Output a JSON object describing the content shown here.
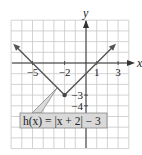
{
  "chart_data": {
    "type": "line",
    "title": "",
    "function_label": "h(x) = |x + 2| − 3",
    "xlabel": "x",
    "ylabel": "y",
    "xlim": [
      -7,
      4
    ],
    "ylim": [
      -8,
      4
    ],
    "grid": true,
    "x_tick_labels": [
      "−5",
      "−2",
      "1",
      "3"
    ],
    "x_tick_values": [
      -5,
      -2,
      1,
      3
    ],
    "y_tick_labels": [
      "−3",
      "−4"
    ],
    "y_tick_values": [
      -3,
      -4
    ],
    "series": [
      {
        "name": "h(x) = |x + 2| − 3",
        "x": [
          -6.5,
          -5,
          -2,
          1,
          2.5
        ],
        "y": [
          1.5,
          0,
          -3,
          0,
          1.5
        ],
        "vertex": [
          -2,
          -3
        ]
      }
    ],
    "colors": {
      "grid": "#c8c8c8",
      "axis": "#333333",
      "line": "#555555",
      "label_box_fill": "#d9d9d9",
      "label_box_border": "#888888"
    }
  }
}
